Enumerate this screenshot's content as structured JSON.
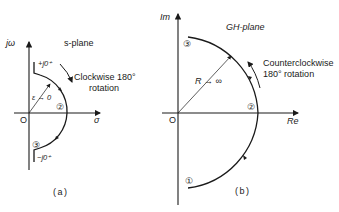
{
  "figure": {
    "panels": [
      {
        "id": "a",
        "caption": "(a)",
        "plane_label": "s-plane",
        "axes": {
          "vertical": "jω",
          "horizontal": "σ",
          "origin": "O"
        },
        "labels": {
          "upper": "+j0⁺",
          "lower": "−j0⁺",
          "epsilon": "ε → 0"
        },
        "rotation_note_line1": "Clockwise 180°",
        "rotation_note_line2": "rotation",
        "points": [
          "③",
          "②",
          "③"
        ],
        "point_labels": {
          "p2": "②",
          "p3": "③"
        }
      },
      {
        "id": "b",
        "caption": "(b)",
        "plane_label": "GH-plane",
        "axes": {
          "vertical": "Im",
          "horizontal": "Re",
          "origin": "O"
        },
        "labels": {
          "radius": "R → ∞"
        },
        "rotation_note_line1": "Counterclockwise",
        "rotation_note_line2": "180° rotation",
        "point_labels": {
          "p1": "①",
          "p2": "②",
          "p3": "③"
        }
      }
    ]
  }
}
